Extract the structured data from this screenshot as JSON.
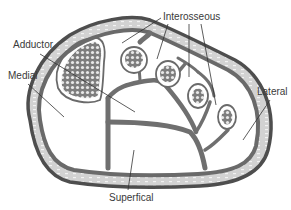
{
  "figure": {
    "colors": {
      "outline": "#555555",
      "fascia_fill": "#d4d4d4",
      "septum": "#6f6f6f",
      "bone_fill": "#8a8a8a",
      "background": "#ffffff",
      "leader_line": "#333333"
    }
  },
  "labels": {
    "interosseous": "Interosseous",
    "adductor": "Adductor",
    "medial": "Medial",
    "lateral": "Lateral",
    "superficial": "Superfical"
  }
}
